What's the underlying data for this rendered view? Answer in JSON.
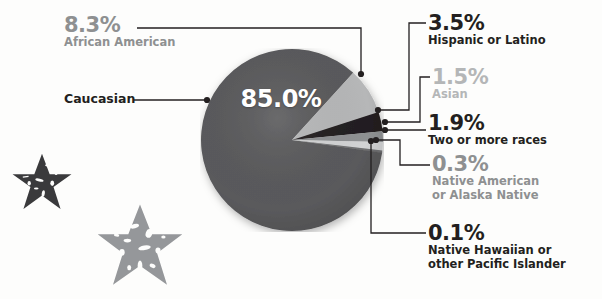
{
  "chart_data": {
    "type": "pie",
    "title": "",
    "center_label": "85.0%",
    "categories": [
      "Caucasian",
      "African American",
      "Hispanic or Latino",
      "Two or more races",
      "Asian",
      "Native American or Alaska Native",
      "Native Hawaiian or other Pacific Islander"
    ],
    "values": [
      85.0,
      8.3,
      3.5,
      1.9,
      1.5,
      0.3,
      0.1
    ],
    "value_labels": [
      "85.0%",
      "8.3%",
      "3.5%",
      "1.9%",
      "1.5%",
      "0.3%",
      "0.1%"
    ],
    "colors": [
      "#5a5a5c",
      "#b6b7b8",
      "#231f20",
      "#8e9092",
      "#d2d3d4",
      "#6f7072",
      "#3c3c3e"
    ],
    "legend": "callout-labels",
    "grid": false,
    "xlabel": "",
    "ylabel": ""
  },
  "callouts": {
    "african_american": {
      "pct": "8.3%",
      "name": "African American",
      "tone": "mid"
    },
    "caucasian": {
      "name": "Caucasian"
    },
    "hispanic": {
      "pct": "3.5%",
      "name": "Hispanic or Latino",
      "tone": "dark"
    },
    "asian": {
      "pct": "1.5%",
      "name": "Asian",
      "tone": "light"
    },
    "two_or_more": {
      "pct": "1.9%",
      "name": "Two or more races",
      "tone": "dark"
    },
    "native_american": {
      "pct": "0.3%",
      "name_line1": "Native American",
      "name_line2": "or Alaska Native",
      "tone": "mid"
    },
    "native_hawaiian": {
      "pct": "0.1%",
      "name_line1": "Native Hawaiian or",
      "name_line2": "other Pacific Islander",
      "tone": "dark"
    }
  },
  "decor": {
    "star_dark_color": "#3a3a3c",
    "star_gray_color": "#95979a",
    "background_color": "#fdfdfc"
  }
}
